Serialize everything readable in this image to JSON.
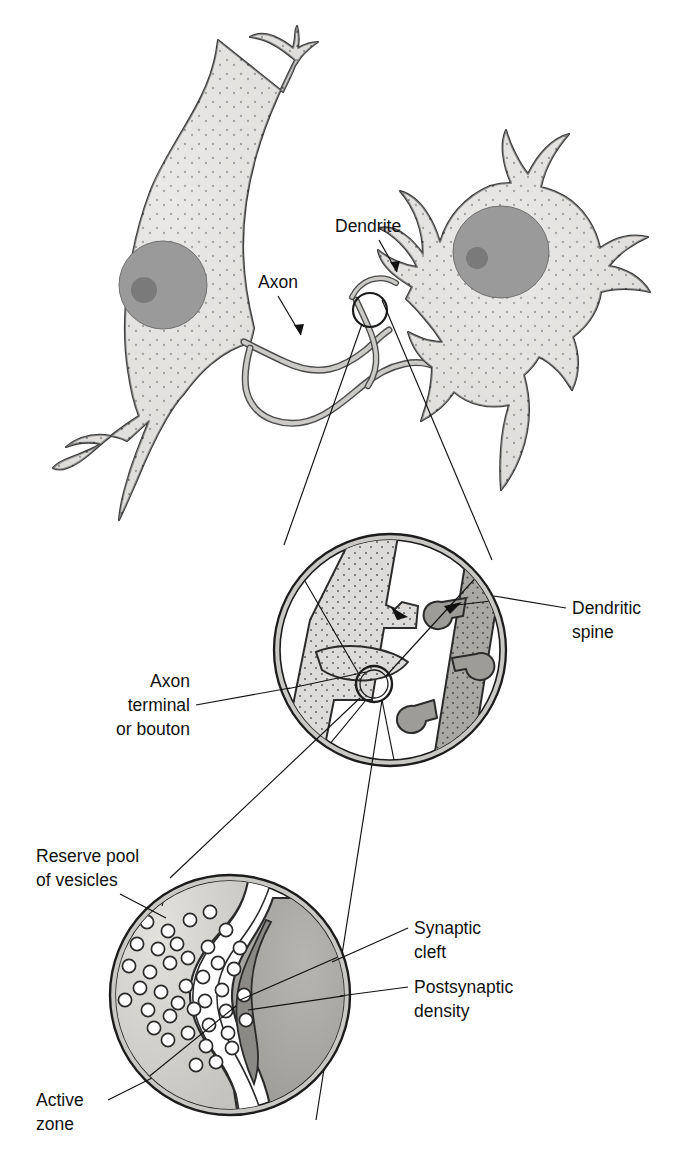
{
  "figure": {
    "background_color": "#ffffff",
    "line_color": "#2b2b2b",
    "text_color": "#111111"
  },
  "palette": {
    "cytoplasm_light": "#dededd",
    "cytoplasm_light2": "#e6e5e3",
    "nucleus": "#9a9a9a",
    "nucleolus": "#7b7b7b",
    "axon_fill": "#d9d8d6",
    "dendrite_fill": "#a8a8a6",
    "terminal_fill": "#dcdbd9",
    "inset_rim": "#c9c8c5",
    "bouton_fill": "#cfcecb",
    "postsynaptic_fill": "#a6a5a2",
    "psd_fill": "#8c8b88",
    "cleft_white": "#ffffff",
    "vesicle_fill": "#ffffff"
  },
  "labels": {
    "top_panel": [
      {
        "id": "dendrite",
        "text": "Dendrite",
        "x": 335,
        "y": 232,
        "anchor": "start",
        "lines": [
          "Dendrite"
        ]
      },
      {
        "id": "axon",
        "text": "Axon",
        "x": 258,
        "y": 288,
        "anchor": "start",
        "lines": [
          "Axon"
        ]
      }
    ],
    "middle_panel": [
      {
        "id": "dendritic-spine",
        "text": "Dendritic spine",
        "x": 572,
        "y": 614,
        "anchor": "start",
        "lines": [
          "Dendritic",
          "spine"
        ]
      },
      {
        "id": "axon-terminal",
        "text": "Axon terminal or bouton",
        "x": 190,
        "y": 687,
        "anchor": "end",
        "lines": [
          "Axon",
          "terminal",
          "or bouton"
        ]
      }
    ],
    "bottom_panel": [
      {
        "id": "reserve-pool",
        "text": "Reserve pool of vesicles",
        "x": 36,
        "y": 862,
        "anchor": "start",
        "lines": [
          "Reserve pool",
          "of vesicles"
        ]
      },
      {
        "id": "synaptic-cleft",
        "text": "Synaptic cleft",
        "x": 414,
        "y": 934,
        "anchor": "start",
        "lines": [
          "Synaptic",
          "cleft"
        ]
      },
      {
        "id": "postsynaptic-density",
        "text": "Postsynaptic density",
        "x": 414,
        "y": 993,
        "anchor": "start",
        "lines": [
          "Postsynaptic",
          "density"
        ]
      },
      {
        "id": "active-zone",
        "text": "Active zone",
        "x": 36,
        "y": 1106,
        "anchor": "start",
        "lines": [
          "Active",
          "zone"
        ]
      }
    ]
  },
  "label_text": {
    "dendrite": "Dendrite",
    "axon": "Axon",
    "dendritic_spine_l1": "Dendritic",
    "dendritic_spine_l2": "spine",
    "axon_terminal_l1": "Axon",
    "axon_terminal_l2": "terminal",
    "axon_terminal_l3": "or bouton",
    "reserve_pool_l1": "Reserve pool",
    "reserve_pool_l2": "of vesicles",
    "synaptic_cleft_l1": "Synaptic",
    "synaptic_cleft_l2": "cleft",
    "postsynaptic_density_l1": "Postsynaptic",
    "postsynaptic_density_l2": "density",
    "active_zone_l1": "Active",
    "active_zone_l2": "zone"
  },
  "insets": {
    "magnifier_top": {
      "cx": 370,
      "cy": 310,
      "r": 17
    },
    "magnifier_middle": {
      "cx": 374,
      "cy": 684,
      "r": 18
    },
    "circle_middle": {
      "cx": 390,
      "cy": 650,
      "r": 116
    },
    "circle_bottom": {
      "cx": 230,
      "cy": 995,
      "r": 120
    }
  },
  "vesicle_count": 40
}
